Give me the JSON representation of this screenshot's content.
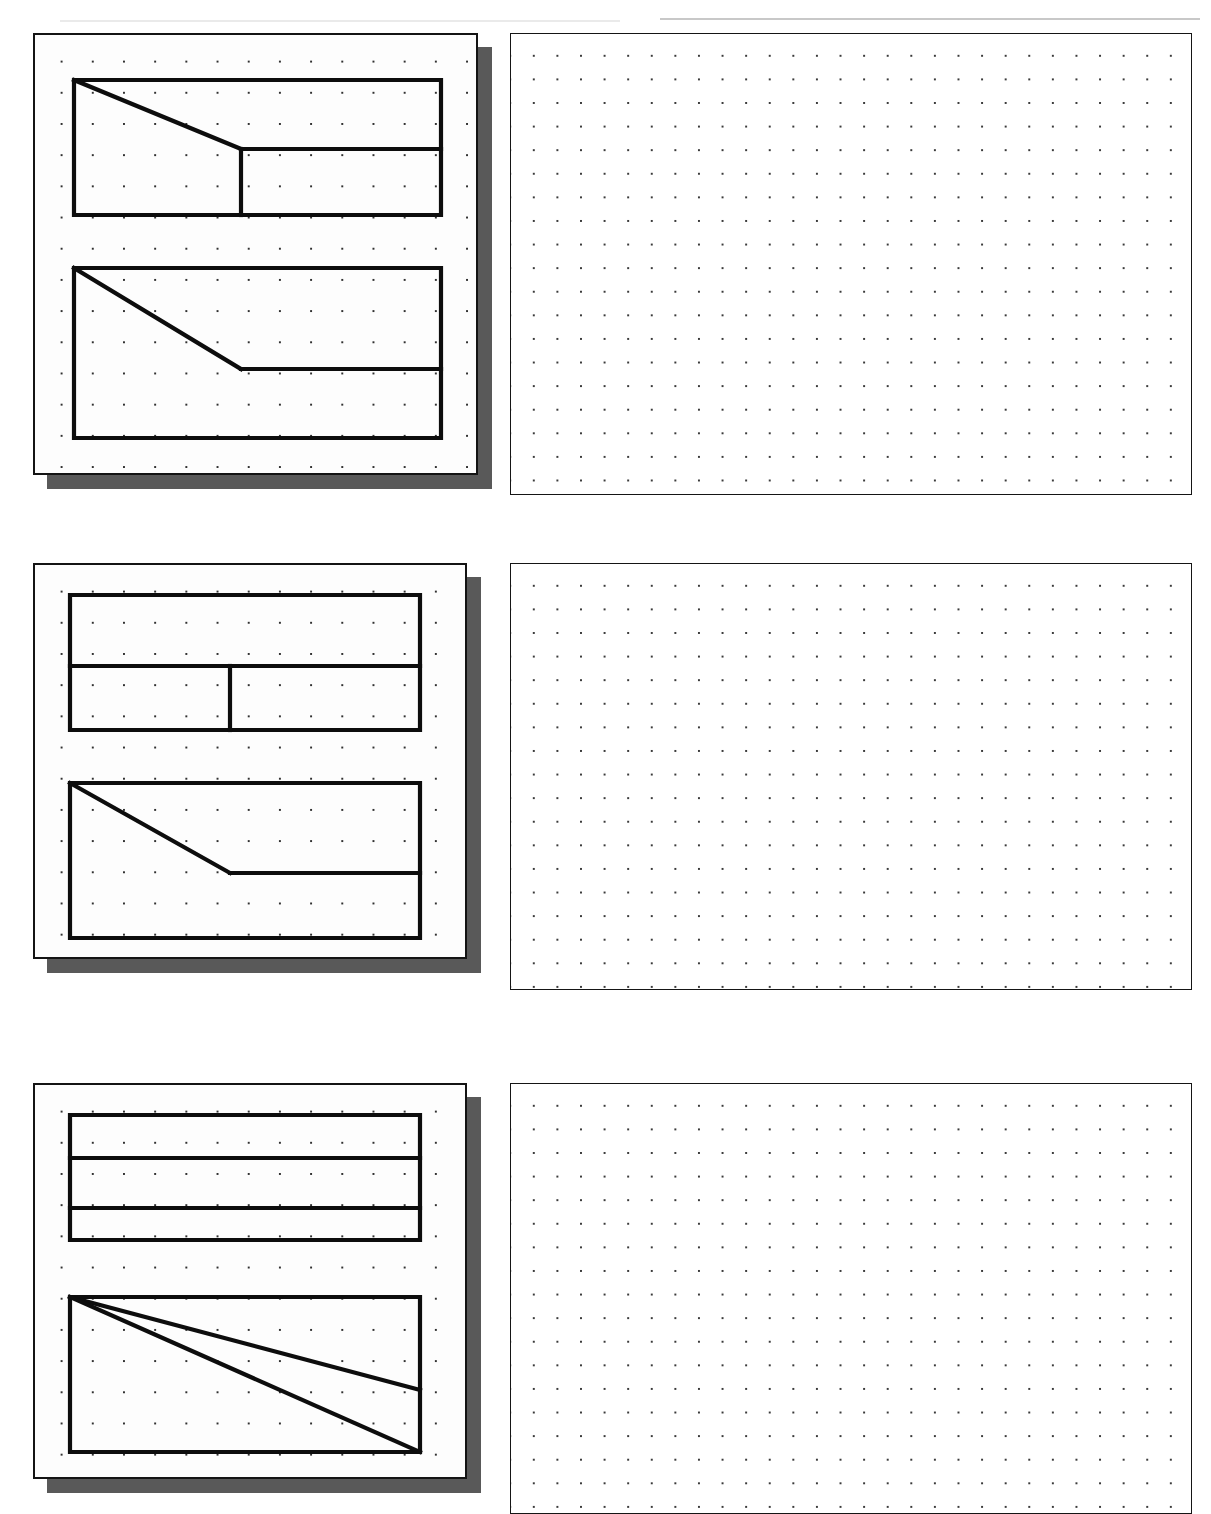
{
  "worksheet": {
    "title": "Orthographic to Isometric Projection Exercise",
    "sheet_width": 1211,
    "sheet_height": 1514,
    "background_color": "#ffffff",
    "line_color": "#0d0d0d",
    "dot_color": "#303030",
    "shadow_color": "#595959"
  },
  "problems": [
    {
      "id": "problem-1",
      "number": "1",
      "given": {
        "card": {
          "x": 33,
          "y": 33,
          "width": 445,
          "height": 442
        },
        "shadow": {
          "dx": 14,
          "dy": 14
        },
        "dot_spacing": 31.2,
        "views": [
          {
            "name": "top-view",
            "label": "Top View",
            "x": 74,
            "y": 80,
            "width": 367,
            "height": 135,
            "outline_points": "0,0 367,0 367,135 0,135 0,0",
            "interior_edges": [
              {
                "name": "chamfer-diagonal",
                "points": "0,0 167,69"
              },
              {
                "name": "vertical-divider",
                "points": "167,69 167,135"
              },
              {
                "name": "horizontal-divider",
                "points": "167,69 367,69"
              }
            ]
          },
          {
            "name": "front-view",
            "label": "Front View",
            "x": 74,
            "y": 268,
            "width": 367,
            "height": 170,
            "outline_points": "0,0 367,0 367,170 0,170 0,0",
            "interior_edges": [
              {
                "name": "slope-diagonal",
                "points": "0,0 167,101"
              },
              {
                "name": "horizontal-edge",
                "points": "167,101 367,101"
              }
            ]
          }
        ]
      },
      "answer_grid": {
        "x": 510,
        "y": 33,
        "width": 682,
        "height": 462,
        "dot_spacing": 23.6,
        "state": "empty"
      }
    },
    {
      "id": "problem-2",
      "number": "2",
      "given": {
        "card": {
          "x": 33,
          "y": 563,
          "width": 434,
          "height": 396
        },
        "shadow": {
          "dx": 14,
          "dy": 14
        },
        "dot_spacing": 31.2,
        "views": [
          {
            "name": "top-view",
            "label": "Top View",
            "x": 70,
            "y": 595,
            "width": 350,
            "height": 135,
            "outline_points": "0,0 350,0 350,135 0,135 0,0",
            "interior_edges": [
              {
                "name": "horizontal-divider",
                "points": "0,71 350,71"
              },
              {
                "name": "vertical-divider",
                "points": "160,71 160,135"
              }
            ]
          },
          {
            "name": "front-view",
            "label": "Front View",
            "x": 70,
            "y": 783,
            "width": 350,
            "height": 155,
            "outline_points": "0,0 350,0 350,155 0,155 0,0",
            "interior_edges": [
              {
                "name": "slope-diagonal",
                "points": "0,0 160,90"
              },
              {
                "name": "horizontal-edge",
                "points": "160,90 350,90"
              }
            ]
          }
        ]
      },
      "answer_grid": {
        "x": 510,
        "y": 563,
        "width": 682,
        "height": 427,
        "dot_spacing": 23.6,
        "state": "empty"
      }
    },
    {
      "id": "problem-3",
      "number": "3",
      "given": {
        "card": {
          "x": 33,
          "y": 1083,
          "width": 434,
          "height": 396
        },
        "shadow": {
          "dx": 14,
          "dy": 14
        },
        "dot_spacing": 31.2,
        "views": [
          {
            "name": "top-view",
            "label": "Top View",
            "x": 70,
            "y": 1115,
            "width": 350,
            "height": 125,
            "outline_points": "0,0 350,0 350,125 0,125 0,0",
            "interior_edges": [
              {
                "name": "horizontal-divider-upper",
                "points": "0,43 350,43"
              },
              {
                "name": "horizontal-divider-lower",
                "points": "0,93 350,93"
              }
            ]
          },
          {
            "name": "front-view",
            "label": "Front View",
            "x": 70,
            "y": 1297,
            "width": 350,
            "height": 155,
            "outline_points": "0,0 350,0 350,155 0,155 0,0",
            "interior_edges": [
              {
                "name": "upper-diagonal",
                "points": "0,0 350,93"
              },
              {
                "name": "lower-diagonal",
                "points": "0,0 350,155"
              }
            ]
          }
        ]
      },
      "answer_grid": {
        "x": 510,
        "y": 1083,
        "width": 682,
        "height": 431,
        "dot_spacing": 23.6,
        "state": "empty"
      }
    }
  ]
}
